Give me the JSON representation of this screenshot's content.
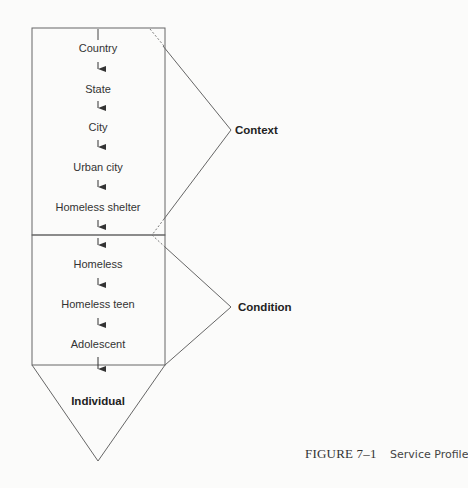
{
  "diagram": {
    "context_levels": [
      {
        "label": "Country"
      },
      {
        "label": "State"
      },
      {
        "label": "City"
      },
      {
        "label": "Urban city"
      },
      {
        "label": "Homeless shelter"
      }
    ],
    "condition_levels": [
      {
        "label": "Homeless"
      },
      {
        "label": "Homeless teen"
      },
      {
        "label": "Adolescent"
      }
    ],
    "individual_label": "Individual",
    "group_labels": {
      "context": "Context",
      "condition": "Condition"
    },
    "colors": {
      "line": "#555555",
      "background": "#fbfbfa",
      "text": "#333333"
    }
  },
  "caption": {
    "figure_number": "FIGURE 7–1",
    "title": "Service Profile"
  }
}
